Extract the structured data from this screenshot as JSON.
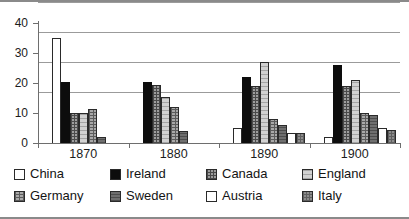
{
  "chart_data": {
    "type": "bar",
    "title": "",
    "xlabel": "",
    "ylabel": "",
    "categories": [
      "1870",
      "1880",
      "1890",
      "1900"
    ],
    "ylim": [
      0,
      40
    ],
    "yticks": [
      0,
      10,
      20,
      30,
      40
    ],
    "grid": true,
    "legend_position": "bottom",
    "series": [
      {
        "name": "China",
        "swatch": "white",
        "color": "#ffffff",
        "values": [
          35,
          0,
          5,
          2
        ]
      },
      {
        "name": "Ireland",
        "swatch": "black",
        "color": "#0d0d0d",
        "values": [
          20.5,
          20.5,
          22,
          26
        ]
      },
      {
        "name": "Canada",
        "swatch": "cross-hatch",
        "color": "#9d9d9d",
        "values": [
          10,
          19.5,
          19,
          19
        ]
      },
      {
        "name": "England",
        "swatch": "light-hatch",
        "color": "#d2d2d2",
        "values": [
          10,
          15.5,
          27,
          21
        ]
      },
      {
        "name": "Germany",
        "swatch": "grid-hatch",
        "color": "#a8a8a8",
        "values": [
          11.5,
          12,
          8,
          10
        ]
      },
      {
        "name": "Sweden",
        "swatch": "dark-gray",
        "color": "#6f6f6f",
        "values": [
          2,
          4,
          6,
          9.5
        ]
      },
      {
        "name": "Austria",
        "swatch": "white",
        "color": "#ffffff",
        "values": [
          0,
          0,
          3.5,
          5
        ]
      },
      {
        "name": "Italy",
        "swatch": "medium-gray-hatch",
        "color": "#8c8c8c",
        "values": [
          0,
          0,
          3.5,
          4.5
        ]
      }
    ]
  },
  "axis": {
    "y_tick_labels": [
      "40",
      "30",
      "20",
      "10",
      "0"
    ]
  },
  "legend": {
    "rows": [
      [
        {
          "label": "China",
          "swatch_class": "sw-china"
        },
        {
          "label": "Ireland",
          "swatch_class": "sw-ireland"
        },
        {
          "label": "Canada",
          "swatch_class": "sw-canada"
        },
        {
          "label": "England",
          "swatch_class": "sw-england"
        }
      ],
      [
        {
          "label": "Germany",
          "swatch_class": "sw-germany"
        },
        {
          "label": "Sweden",
          "swatch_class": "sw-sweden"
        },
        {
          "label": "Austria",
          "swatch_class": "sw-austria"
        },
        {
          "label": "Italy",
          "swatch_class": "sw-italy"
        }
      ]
    ]
  }
}
